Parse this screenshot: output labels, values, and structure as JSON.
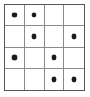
{
  "puzzle": {
    "title": "4x4 dot grid",
    "rows": 4,
    "columns": 4,
    "dot_symbol": "•",
    "colors": {
      "background": "#ffffff",
      "outer_border": "#555555",
      "grid_line": "#8a8a8a",
      "dot": "#1a1a1a"
    },
    "cells": [
      {
        "row": 1,
        "col": 1,
        "dot": true
      },
      {
        "row": 1,
        "col": 2,
        "dot": true
      },
      {
        "row": 1,
        "col": 3,
        "dot": false
      },
      {
        "row": 1,
        "col": 4,
        "dot": false
      },
      {
        "row": 2,
        "col": 1,
        "dot": false
      },
      {
        "row": 2,
        "col": 2,
        "dot": true
      },
      {
        "row": 2,
        "col": 3,
        "dot": false
      },
      {
        "row": 2,
        "col": 4,
        "dot": true
      },
      {
        "row": 3,
        "col": 1,
        "dot": true
      },
      {
        "row": 3,
        "col": 2,
        "dot": false
      },
      {
        "row": 3,
        "col": 3,
        "dot": true
      },
      {
        "row": 3,
        "col": 4,
        "dot": false
      },
      {
        "row": 4,
        "col": 1,
        "dot": false
      },
      {
        "row": 4,
        "col": 2,
        "dot": false
      },
      {
        "row": 4,
        "col": 3,
        "dot": true
      },
      {
        "row": 4,
        "col": 4,
        "dot": true
      }
    ],
    "dot_count": 8
  }
}
